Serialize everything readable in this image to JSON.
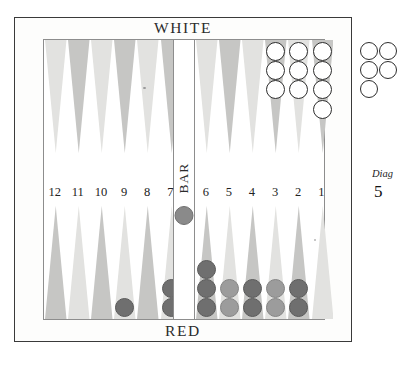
{
  "diagram": {
    "top_player_label": "WHITE",
    "bottom_player_label": "RED",
    "bar_label": "BAR",
    "caption_word": "Diag",
    "caption_number": "5"
  },
  "colors": {
    "outer_frame": "#3a3a3a",
    "board_background": "#fdfdfc",
    "play_area_background": "#ffffff",
    "point_light": "#e2e2e0",
    "point_dark": "#c6c6c4",
    "white_checker_fill": "#ffffff",
    "white_checker_stroke": "#2d2d2d",
    "red_checker_dark": "#6f6f6f",
    "red_checker_light": "#9c9c9c",
    "text": "#222222"
  },
  "point_numbers": [
    "12",
    "11",
    "10",
    "9",
    "8",
    "7",
    "6",
    "5",
    "4",
    "3",
    "2",
    "1"
  ],
  "board_state": {
    "top_points": [
      {
        "number": "12",
        "shade": "light",
        "checkers": 0,
        "color": "none"
      },
      {
        "number": "11",
        "shade": "dark",
        "checkers": 0,
        "color": "none"
      },
      {
        "number": "10",
        "shade": "light",
        "checkers": 0,
        "color": "none"
      },
      {
        "number": "9",
        "shade": "dark",
        "checkers": 0,
        "color": "none"
      },
      {
        "number": "8",
        "shade": "light",
        "checkers": 0,
        "color": "none"
      },
      {
        "number": "7",
        "shade": "dark",
        "checkers": 0,
        "color": "none"
      },
      {
        "number": "6",
        "shade": "light",
        "checkers": 0,
        "color": "none"
      },
      {
        "number": "5",
        "shade": "dark",
        "checkers": 0,
        "color": "none"
      },
      {
        "number": "4",
        "shade": "light",
        "checkers": 0,
        "color": "none"
      },
      {
        "number": "3",
        "shade": "dark",
        "checkers": 3,
        "color": "white"
      },
      {
        "number": "2",
        "shade": "light",
        "checkers": 3,
        "color": "white"
      },
      {
        "number": "1",
        "shade": "dark",
        "checkers": 4,
        "color": "white"
      }
    ],
    "bottom_points": [
      {
        "number": "12",
        "shade": "dark",
        "checkers": 0,
        "color": "none"
      },
      {
        "number": "11",
        "shade": "light",
        "checkers": 0,
        "color": "none"
      },
      {
        "number": "10",
        "shade": "dark",
        "checkers": 0,
        "color": "none"
      },
      {
        "number": "9",
        "shade": "light",
        "checkers": 1,
        "color": "red-dark"
      },
      {
        "number": "8",
        "shade": "dark",
        "checkers": 0,
        "color": "none"
      },
      {
        "number": "7",
        "shade": "light",
        "checkers": 2,
        "color": "red-dark"
      },
      {
        "number": "6",
        "shade": "dark",
        "checkers": 3,
        "color": "red-dark"
      },
      {
        "number": "5",
        "shade": "light",
        "checkers": 2,
        "color": "red-light"
      },
      {
        "number": "4",
        "shade": "dark",
        "checkers": 2,
        "color": "red-dark"
      },
      {
        "number": "3",
        "shade": "light",
        "checkers": 2,
        "color": "red-light"
      },
      {
        "number": "2",
        "shade": "dark",
        "checkers": 2,
        "color": "red-dark"
      },
      {
        "number": "1",
        "shade": "light",
        "checkers": 0,
        "color": "none"
      }
    ],
    "bar": {
      "red_checkers": 1,
      "white_checkers": 0
    },
    "borne_off": {
      "white": 5,
      "red": 0
    }
  }
}
